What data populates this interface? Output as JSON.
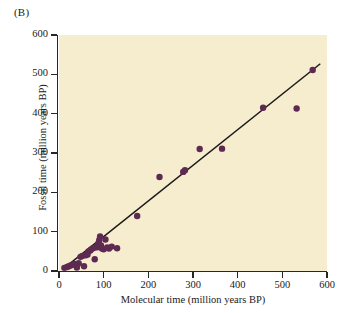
{
  "panel": {
    "label": "(B)"
  },
  "chart_data": {
    "type": "scatter",
    "title": "",
    "xlabel": "Molecular time (million years BP)",
    "ylabel": "Fossil time (million years BP)",
    "xlim": [
      0,
      600
    ],
    "ylim": [
      0,
      600
    ],
    "xticks": [
      0,
      100,
      200,
      300,
      400,
      500,
      600
    ],
    "yticks": [
      0,
      100,
      200,
      300,
      400,
      500,
      600
    ],
    "xtick_labels": [
      "0",
      "100",
      "200",
      "300",
      "400",
      "500",
      "600"
    ],
    "ytick_labels": [
      "0",
      "100",
      "200",
      "300",
      "400",
      "500",
      "600"
    ],
    "grid": false,
    "legend": null,
    "point_color": "#5e2a52",
    "line_color": "#1a1a1a",
    "plot_background": "#f6ecce",
    "figure_background": "#ffffff",
    "marker_radius": 3.2,
    "series": [
      {
        "name": "Molecular vs fossil divergence times",
        "x": [
          12,
          18,
          22,
          26,
          30,
          34,
          40,
          44,
          48,
          52,
          56,
          60,
          64,
          66,
          70,
          72,
          76,
          80,
          84,
          86,
          88,
          90,
          92,
          94,
          96,
          100,
          104,
          108,
          112,
          118,
          130,
          175,
          225,
          278,
          282,
          315,
          365,
          457,
          532,
          568
        ],
        "y": [
          8,
          10,
          12,
          14,
          16,
          18,
          9,
          20,
          36,
          38,
          12,
          40,
          42,
          50,
          52,
          55,
          58,
          30,
          60,
          62,
          70,
          78,
          88,
          65,
          57,
          55,
          80,
          60,
          57,
          62,
          58,
          140,
          239,
          252,
          256,
          310,
          311,
          415,
          413,
          511
        ]
      }
    ],
    "trendline": {
      "name": "1:1 regression line",
      "x_start": 8,
      "y_start": 4,
      "x_end": 585,
      "y_end": 527
    }
  }
}
